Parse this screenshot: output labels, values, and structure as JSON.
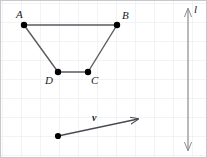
{
  "figure": {
    "width": 207,
    "height": 158,
    "background_color": "#ffffff",
    "border_color": "#c8c8cc",
    "grid": {
      "visible": true,
      "color": "#e6e8ec",
      "spacing": 19,
      "origin_x": 2,
      "origin_y": 3
    },
    "stroke_color": "#5a5a60",
    "point_color": "#000000",
    "axis_color": "#8a8a90"
  },
  "polygon": {
    "name": "trapezoid-abcd",
    "vertices": [
      {
        "id": "A",
        "label": "A",
        "x": 24,
        "y": 25,
        "label_x": 16,
        "label_y": 9
      },
      {
        "id": "B",
        "label": "B",
        "x": 117,
        "y": 25,
        "label_x": 122,
        "label_y": 10
      },
      {
        "id": "C",
        "label": "C",
        "x": 88,
        "y": 72,
        "label_x": 91,
        "label_y": 75
      },
      {
        "id": "D",
        "label": "D",
        "x": 58,
        "y": 72,
        "label_x": 45,
        "label_y": 75
      }
    ],
    "edges": [
      {
        "from": "A",
        "to": "B"
      },
      {
        "from": "B",
        "to": "C"
      },
      {
        "from": "C",
        "to": "D"
      },
      {
        "from": "D",
        "to": "A"
      }
    ]
  },
  "vector": {
    "name": "vector-v",
    "label": "v",
    "label_x": 92,
    "label_y": 112,
    "start_x": 58,
    "start_y": 136,
    "end_x": 138,
    "end_y": 119,
    "arrowhead": "single-end"
  },
  "line": {
    "name": "line-l",
    "label": "l",
    "label_x": 194,
    "label_y": 4,
    "x": 188,
    "top_y": 9,
    "bottom_y": 150,
    "arrowhead": "double-ended"
  }
}
